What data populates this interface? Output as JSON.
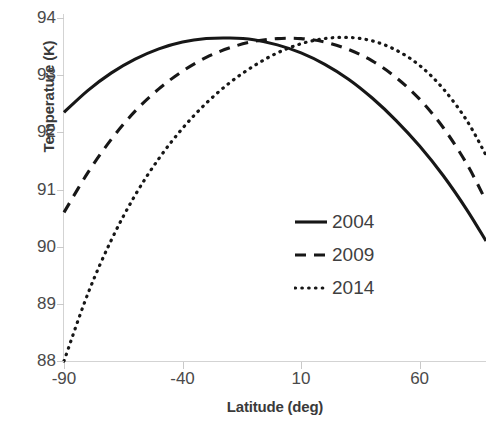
{
  "chart_data": {
    "type": "line",
    "title": "",
    "xlabel": "Latitude (deg)",
    "ylabel": "Temperature (K)",
    "xlim": [
      -90,
      88
    ],
    "ylim": [
      88,
      94
    ],
    "xticks": [
      -90,
      -40,
      10,
      60
    ],
    "xtick_labels": [
      "-90",
      "-40",
      "10",
      "60"
    ],
    "yticks": [
      88,
      89,
      90,
      91,
      92,
      93,
      94
    ],
    "ytick_labels": [
      "88",
      "89",
      "90",
      "91",
      "92",
      "93",
      "94"
    ],
    "grid": false,
    "legend_position": "center-right",
    "series": [
      {
        "name": "2004",
        "style": "solid",
        "color": "#171717",
        "x": [
          -90,
          -80,
          -70,
          -60,
          -50,
          -40,
          -30,
          -20,
          -10,
          0,
          10,
          20,
          30,
          40,
          50,
          60,
          70,
          80,
          88
        ],
        "y": [
          92.35,
          92.73,
          93.04,
          93.28,
          93.46,
          93.58,
          93.64,
          93.65,
          93.62,
          93.53,
          93.39,
          93.19,
          92.93,
          92.6,
          92.21,
          91.76,
          91.24,
          90.64,
          90.1
        ]
      },
      {
        "name": "2009",
        "style": "dashed",
        "color": "#171717",
        "x": [
          -90,
          -80,
          -70,
          -60,
          -50,
          -40,
          -30,
          -20,
          -10,
          0,
          10,
          20,
          30,
          40,
          50,
          60,
          70,
          80,
          88
        ],
        "y": [
          90.6,
          91.29,
          91.88,
          92.37,
          92.76,
          93.07,
          93.31,
          93.48,
          93.59,
          93.64,
          93.64,
          93.58,
          93.45,
          93.25,
          92.96,
          92.58,
          92.08,
          91.44,
          90.8
        ]
      },
      {
        "name": "2014",
        "style": "dotted",
        "color": "#171717",
        "x": [
          -90,
          -80,
          -70,
          -60,
          -50,
          -40,
          -30,
          -20,
          -10,
          0,
          10,
          20,
          30,
          40,
          50,
          60,
          70,
          80,
          88
        ],
        "y": [
          88.0,
          89.17,
          90.12,
          90.9,
          91.54,
          92.07,
          92.51,
          92.87,
          93.16,
          93.39,
          93.55,
          93.64,
          93.66,
          93.6,
          93.44,
          93.17,
          92.76,
          92.2,
          91.6
        ]
      }
    ]
  },
  "legend": {
    "items": [
      {
        "label": "2004",
        "style": "solid"
      },
      {
        "label": "2009",
        "style": "dashed"
      },
      {
        "label": "2014",
        "style": "dotted"
      }
    ]
  },
  "axes": {
    "y_title": "Temperature (K)",
    "x_title": "Latitude (deg)"
  }
}
